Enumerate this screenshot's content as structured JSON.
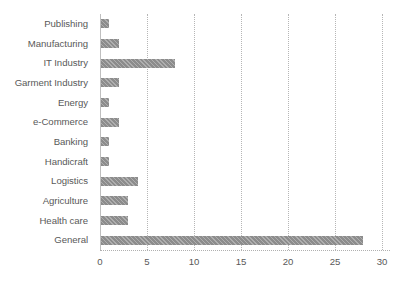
{
  "chart_data": {
    "type": "bar",
    "orientation": "horizontal",
    "title": "",
    "subtitle": "",
    "xlabel": "",
    "ylabel": "",
    "categories": [
      "Publishing",
      "Manufacturing",
      "IT Industry",
      "Garment Industry",
      "Energy",
      "e-Commerce",
      "Banking",
      "Handicraft",
      "Logistics",
      "Agriculture",
      "Health care",
      "General"
    ],
    "values": [
      1,
      2,
      8,
      2,
      1,
      2,
      1,
      1,
      4,
      3,
      3,
      28
    ],
    "xlim": [
      0,
      30
    ],
    "xticks": [
      0,
      5,
      10,
      15,
      20,
      25,
      30
    ],
    "xtick_labels": [
      "0",
      "5",
      "10",
      "15",
      "20",
      "25",
      "30"
    ],
    "grid": "vertical-dotted",
    "legend": "none",
    "bar_color": "#8c8c8c",
    "grid_color": "#b6b6b6",
    "text_color": "#595959",
    "background": "#ffffff"
  }
}
